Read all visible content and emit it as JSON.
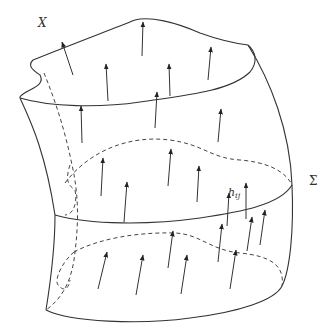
{
  "diagram": {
    "labels": {
      "X": "X",
      "Sigma": "Σ",
      "h_base": "h",
      "h_sub": "ij"
    },
    "colors": {
      "stroke": "#333333",
      "background": "#ffffff"
    },
    "arrows": [
      {
        "x1": 73,
        "y1": 75,
        "x2": 62,
        "y2": 42
      },
      {
        "x1": 108,
        "y1": 101,
        "x2": 106,
        "y2": 64
      },
      {
        "x1": 142,
        "y1": 56,
        "x2": 143,
        "y2": 22
      },
      {
        "x1": 170,
        "y1": 96,
        "x2": 169,
        "y2": 64
      },
      {
        "x1": 208,
        "y1": 80,
        "x2": 211,
        "y2": 47
      },
      {
        "x1": 82,
        "y1": 143,
        "x2": 81,
        "y2": 106
      },
      {
        "x1": 155,
        "y1": 128,
        "x2": 157,
        "y2": 92
      },
      {
        "x1": 218,
        "y1": 142,
        "x2": 221,
        "y2": 109
      },
      {
        "x1": 101,
        "y1": 196,
        "x2": 103,
        "y2": 158
      },
      {
        "x1": 168,
        "y1": 186,
        "x2": 171,
        "y2": 149
      },
      {
        "x1": 197,
        "y1": 202,
        "x2": 199,
        "y2": 166
      },
      {
        "x1": 124,
        "y1": 222,
        "x2": 127,
        "y2": 182
      },
      {
        "x1": 246,
        "y1": 219,
        "x2": 246,
        "y2": 183
      },
      {
        "x1": 227,
        "y1": 226,
        "x2": 229,
        "y2": 193
      },
      {
        "x1": 260,
        "y1": 245,
        "x2": 265,
        "y2": 210
      },
      {
        "x1": 98,
        "y1": 289,
        "x2": 107,
        "y2": 252
      },
      {
        "x1": 136,
        "y1": 295,
        "x2": 143,
        "y2": 255
      },
      {
        "x1": 168,
        "y1": 268,
        "x2": 173,
        "y2": 231
      },
      {
        "x1": 181,
        "y1": 294,
        "x2": 187,
        "y2": 255
      },
      {
        "x1": 218,
        "y1": 262,
        "x2": 222,
        "y2": 224
      },
      {
        "x1": 230,
        "y1": 289,
        "x2": 236,
        "y2": 250
      },
      {
        "x1": 247,
        "y1": 251,
        "x2": 252,
        "y2": 217
      }
    ]
  }
}
